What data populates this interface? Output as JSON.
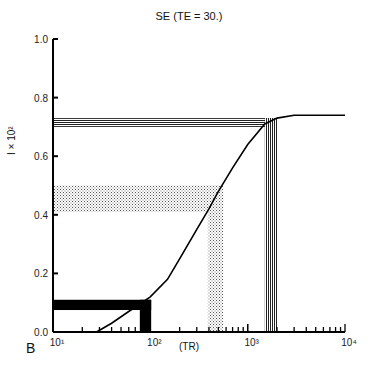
{
  "chart_data": {
    "type": "line",
    "title": "SE (TE = 30.)",
    "xlabel": "(TR)",
    "ylabel": "I × 10²",
    "panel_label": "B",
    "xscale": "log",
    "xlim": [
      10,
      10000
    ],
    "ylim": [
      0.0,
      1.0
    ],
    "x_tick_labels": [
      "10¹",
      "10²",
      "10³",
      "10⁴"
    ],
    "y_tick_labels": [
      "0.0",
      "0.2",
      "0.4",
      "0.6",
      "0.8",
      "1.0"
    ],
    "series": [
      {
        "name": "signal curve",
        "x": [
          28,
          40,
          60,
          100,
          150,
          200,
          300,
          400,
          500,
          700,
          1000,
          1500,
          2000,
          3000,
          5000,
          10000
        ],
        "y": [
          0.0,
          0.03,
          0.07,
          0.12,
          0.18,
          0.25,
          0.35,
          0.42,
          0.48,
          0.56,
          0.64,
          0.71,
          0.73,
          0.74,
          0.74,
          0.74
        ]
      }
    ],
    "bands": [
      {
        "name": "black band",
        "fill": "solid-black",
        "tr_range": [
          78,
          102
        ],
        "i_range": [
          0.075,
          0.11
        ]
      },
      {
        "name": "stippled band",
        "fill": "stipple",
        "tr_range": [
          390,
          560
        ],
        "i_range": [
          0.41,
          0.5
        ]
      },
      {
        "name": "striped band",
        "fill": "vertical-stripes",
        "tr_range": [
          1500,
          2050
        ],
        "i_range": [
          0.7,
          0.73
        ]
      }
    ],
    "grid": false
  }
}
